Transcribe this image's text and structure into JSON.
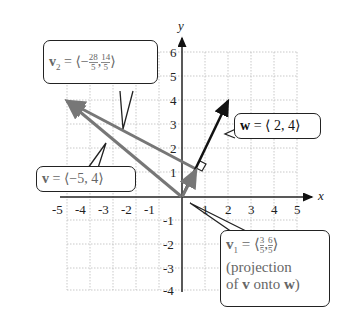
{
  "axes": {
    "x_label": "x",
    "y_label": "y",
    "x_ticks": [
      "-5",
      "-4",
      "-3",
      "-2",
      "-1",
      "1",
      "2",
      "3",
      "4",
      "5"
    ],
    "y_ticks": [
      "6",
      "5",
      "4",
      "3",
      "2",
      "1",
      "-1",
      "-2",
      "-3",
      "-4"
    ]
  },
  "vectors": {
    "v": {
      "name": "v",
      "components": [
        -5,
        4
      ],
      "color": "#777777"
    },
    "w": {
      "name": "w",
      "components": [
        2,
        4
      ],
      "color": "#111111"
    },
    "v1": {
      "name": "v1",
      "components": [
        0.6,
        1.2
      ],
      "color": "#777777"
    },
    "v2": {
      "name": "v2",
      "components": [
        -5.6,
        2.8
      ],
      "color": "#777777"
    }
  },
  "labels": {
    "v2": {
      "lhs": "v",
      "sub": "2",
      "eq": " = ⟨−",
      "n1": "28",
      "d1": "5",
      "sep": ",",
      "n2": "14",
      "d2": "5",
      "close": "⟩"
    },
    "v": {
      "lhs": "v",
      "rest": " = ⟨−5, 4⟩"
    },
    "w": {
      "lhs": "w",
      "rest": " = ⟨ 2, 4⟩"
    },
    "v1": {
      "lhs": "v",
      "sub": "1",
      "eq": " = ⟨",
      "n1": "3",
      "d1": "5",
      "sep": ",",
      "n2": "6",
      "d2": "5",
      "close": "⟩",
      "line2": "(projection",
      "line3_a": "of ",
      "line3_v": "v",
      "line3_b": " onto ",
      "line3_w": "w",
      "line3_c": ")"
    }
  }
}
